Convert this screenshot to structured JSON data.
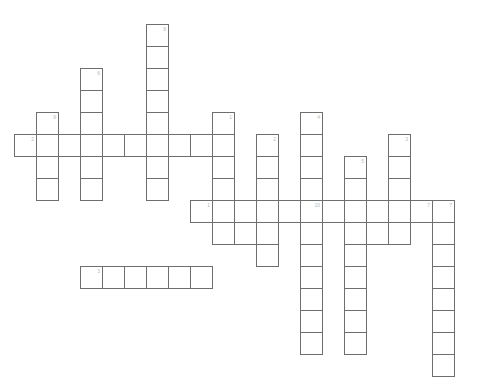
{
  "puzzle": {
    "title": "Crossword Grid",
    "cell_size": 22,
    "origin": {
      "x": 14,
      "y": 24
    },
    "colors": {
      "cell_border": "#6e6e6e",
      "cell_fill": "#ffffff",
      "number": "#b9b9b9",
      "background": "#ffffff"
    },
    "entries": [
      {
        "number": "2",
        "direction": "across",
        "start": {
          "col": 0,
          "row": 5
        },
        "length": 10,
        "cells": [
          {
            "col": 0,
            "row": 5,
            "number": "2"
          },
          {
            "col": 1,
            "row": 5,
            "number": ""
          },
          {
            "col": 2,
            "row": 5,
            "number": ""
          },
          {
            "col": 3,
            "row": 5,
            "number": ""
          },
          {
            "col": 4,
            "row": 5,
            "number": ""
          },
          {
            "col": 5,
            "row": 5,
            "number": ""
          },
          {
            "col": 6,
            "row": 5,
            "number": ""
          },
          {
            "col": 7,
            "row": 5,
            "number": ""
          },
          {
            "col": 8,
            "row": 5,
            "number": ""
          },
          {
            "col": 9,
            "row": 5,
            "number": ""
          }
        ]
      },
      {
        "number": "1",
        "direction": "across",
        "start": {
          "col": 8,
          "row": 8
        },
        "length": 12,
        "cells": [
          {
            "col": 8,
            "row": 8,
            "number": "1"
          },
          {
            "col": 9,
            "row": 8,
            "number": ""
          },
          {
            "col": 10,
            "row": 8,
            "number": ""
          },
          {
            "col": 11,
            "row": 8,
            "number": ""
          },
          {
            "col": 12,
            "row": 8,
            "number": ""
          },
          {
            "col": 13,
            "row": 8,
            "number": "10"
          },
          {
            "col": 14,
            "row": 8,
            "number": ""
          },
          {
            "col": 15,
            "row": 8,
            "number": ""
          },
          {
            "col": 16,
            "row": 8,
            "number": ""
          },
          {
            "col": 17,
            "row": 8,
            "number": ""
          },
          {
            "col": 18,
            "row": 8,
            "number": "7"
          },
          {
            "col": 19,
            "row": 8,
            "number": ""
          }
        ]
      },
      {
        "number": "3",
        "direction": "across",
        "start": {
          "col": 3,
          "row": 11
        },
        "length": 6,
        "cells": [
          {
            "col": 3,
            "row": 11,
            "number": "3"
          },
          {
            "col": 4,
            "row": 11,
            "number": ""
          },
          {
            "col": 5,
            "row": 11,
            "number": ""
          },
          {
            "col": 6,
            "row": 11,
            "number": ""
          },
          {
            "col": 7,
            "row": 11,
            "number": ""
          },
          {
            "col": 8,
            "row": 11,
            "number": ""
          }
        ]
      },
      {
        "number": "9",
        "direction": "down",
        "start": {
          "col": 1,
          "row": 4
        },
        "length": 4,
        "cells": [
          {
            "col": 1,
            "row": 4,
            "number": "9"
          },
          {
            "col": 1,
            "row": 5,
            "number": ""
          },
          {
            "col": 1,
            "row": 6,
            "number": ""
          },
          {
            "col": 1,
            "row": 7,
            "number": ""
          }
        ]
      },
      {
        "number": "6",
        "direction": "down",
        "start": {
          "col": 3,
          "row": 2
        },
        "length": 6,
        "cells": [
          {
            "col": 3,
            "row": 2,
            "number": "6"
          },
          {
            "col": 3,
            "row": 3,
            "number": ""
          },
          {
            "col": 3,
            "row": 4,
            "number": ""
          },
          {
            "col": 3,
            "row": 5,
            "number": ""
          },
          {
            "col": 3,
            "row": 6,
            "number": ""
          },
          {
            "col": 3,
            "row": 7,
            "number": ""
          }
        ]
      },
      {
        "number": "8",
        "direction": "down",
        "start": {
          "col": 6,
          "row": 0
        },
        "length": 8,
        "cells": [
          {
            "col": 6,
            "row": 0,
            "number": "8"
          },
          {
            "col": 6,
            "row": 1,
            "number": ""
          },
          {
            "col": 6,
            "row": 2,
            "number": ""
          },
          {
            "col": 6,
            "row": 3,
            "number": ""
          },
          {
            "col": 6,
            "row": 4,
            "number": ""
          },
          {
            "col": 6,
            "row": 5,
            "number": ""
          },
          {
            "col": 6,
            "row": 6,
            "number": ""
          },
          {
            "col": 6,
            "row": 7,
            "number": ""
          }
        ]
      },
      {
        "number": "1",
        "direction": "down",
        "start": {
          "col": 9,
          "row": 4
        },
        "length": 6,
        "cells": [
          {
            "col": 9,
            "row": 4,
            "number": "1"
          },
          {
            "col": 9,
            "row": 5,
            "number": ""
          },
          {
            "col": 9,
            "row": 6,
            "number": ""
          },
          {
            "col": 9,
            "row": 7,
            "number": ""
          },
          {
            "col": 9,
            "row": 8,
            "number": ""
          },
          {
            "col": 9,
            "row": 9,
            "number": ""
          }
        ]
      },
      {
        "number": "2",
        "direction": "down",
        "start": {
          "col": 11,
          "row": 5
        },
        "length": 6,
        "cells": [
          {
            "col": 11,
            "row": 5,
            "number": "2"
          },
          {
            "col": 11,
            "row": 6,
            "number": ""
          },
          {
            "col": 11,
            "row": 7,
            "number": ""
          },
          {
            "col": 11,
            "row": 8,
            "number": ""
          },
          {
            "col": 11,
            "row": 9,
            "number": ""
          },
          {
            "col": 11,
            "row": 10,
            "number": ""
          }
        ]
      },
      {
        "number": "4",
        "direction": "down",
        "start": {
          "col": 13,
          "row": 4
        },
        "length": 11,
        "cells": [
          {
            "col": 13,
            "row": 4,
            "number": "4"
          },
          {
            "col": 13,
            "row": 5,
            "number": ""
          },
          {
            "col": 13,
            "row": 6,
            "number": ""
          },
          {
            "col": 13,
            "row": 7,
            "number": ""
          },
          {
            "col": 13,
            "row": 8,
            "number": ""
          },
          {
            "col": 13,
            "row": 9,
            "number": ""
          },
          {
            "col": 13,
            "row": 10,
            "number": ""
          },
          {
            "col": 13,
            "row": 11,
            "number": ""
          },
          {
            "col": 13,
            "row": 12,
            "number": ""
          },
          {
            "col": 13,
            "row": 13,
            "number": ""
          },
          {
            "col": 13,
            "row": 14,
            "number": ""
          }
        ]
      },
      {
        "number": "5",
        "direction": "down",
        "start": {
          "col": 15,
          "row": 6
        },
        "length": 9,
        "cells": [
          {
            "col": 15,
            "row": 6,
            "number": "5"
          },
          {
            "col": 15,
            "row": 7,
            "number": ""
          },
          {
            "col": 15,
            "row": 8,
            "number": ""
          },
          {
            "col": 15,
            "row": 9,
            "number": ""
          },
          {
            "col": 15,
            "row": 10,
            "number": ""
          },
          {
            "col": 15,
            "row": 11,
            "number": ""
          },
          {
            "col": 15,
            "row": 12,
            "number": ""
          },
          {
            "col": 15,
            "row": 13,
            "number": ""
          },
          {
            "col": 15,
            "row": 14,
            "number": ""
          }
        ]
      },
      {
        "number": "3",
        "direction": "down",
        "start": {
          "col": 17,
          "row": 5
        },
        "length": 5,
        "cells": [
          {
            "col": 17,
            "row": 5,
            "number": "3"
          },
          {
            "col": 17,
            "row": 6,
            "number": ""
          },
          {
            "col": 17,
            "row": 7,
            "number": ""
          },
          {
            "col": 17,
            "row": 8,
            "number": ""
          },
          {
            "col": 17,
            "row": 9,
            "number": ""
          }
        ]
      },
      {
        "number": "7",
        "direction": "down",
        "start": {
          "col": 19,
          "row": 8
        },
        "length": 8,
        "cells": [
          {
            "col": 19,
            "row": 8,
            "number": "7"
          },
          {
            "col": 19,
            "row": 9,
            "number": ""
          },
          {
            "col": 19,
            "row": 10,
            "number": ""
          },
          {
            "col": 19,
            "row": 11,
            "number": ""
          },
          {
            "col": 19,
            "row": 12,
            "number": ""
          },
          {
            "col": 19,
            "row": 13,
            "number": ""
          },
          {
            "col": 19,
            "row": 14,
            "number": ""
          },
          {
            "col": 19,
            "row": 15,
            "number": ""
          }
        ]
      },
      {
        "number": "",
        "direction": "down",
        "start": {
          "col": 10,
          "row": 9
        },
        "length": 1,
        "cells": [
          {
            "col": 10,
            "row": 9,
            "number": ""
          }
        ]
      },
      {
        "number": "",
        "direction": "down",
        "start": {
          "col": 16,
          "row": 9
        },
        "length": 1,
        "cells": [
          {
            "col": 16,
            "row": 9,
            "number": ""
          }
        ]
      },
      {
        "number": "",
        "direction": "down",
        "start": {
          "col": 6,
          "row": 6
        },
        "length": 1,
        "cells": []
      }
    ]
  }
}
